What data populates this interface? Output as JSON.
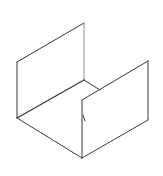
{
  "diagram": {
    "stroke_color": "#3a3a3a",
    "light_stroke_color": "#8a8a8a",
    "background": "#ffffff",
    "edges": {
      "back_top": [
        17,
        62,
        84,
        23
      ],
      "back_right_vertical": [
        84,
        23,
        84,
        80
      ],
      "left_vertical": [
        17,
        62,
        17,
        118
      ],
      "floor_back_edge": [
        17,
        118,
        84,
        80
      ],
      "floor_inner": [
        84,
        80,
        100,
        90
      ],
      "floor_left_front": [
        17,
        118,
        82,
        158
      ],
      "front_left_vertical": [
        82,
        100,
        82,
        158
      ],
      "front_top": [
        82,
        100,
        148,
        61
      ],
      "front_right_vertical": [
        148,
        61,
        148,
        120
      ],
      "front_bottom": [
        82,
        158,
        148,
        120
      ]
    },
    "hinge_mark": [
      83,
      115,
      85,
      121
    ]
  }
}
